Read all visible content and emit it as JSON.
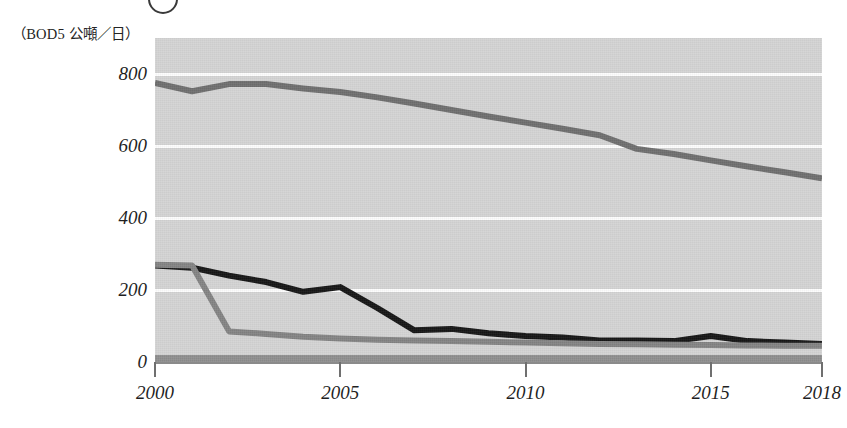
{
  "figure": {
    "badge_name": "circled-number-marker",
    "y_unit_label": "（BOD5 公噸／日）"
  },
  "chart_data": {
    "type": "line",
    "title": "",
    "subtitle": "",
    "xlabel": "",
    "ylabel": "（BOD5 公噸／日）",
    "ylim": [
      0,
      900
    ],
    "xlim": [
      2000,
      2018
    ],
    "grid": true,
    "gridlines": [
      200,
      400,
      600,
      800
    ],
    "legend_position": "none",
    "x": [
      2000,
      2001,
      2002,
      2003,
      2004,
      2005,
      2006,
      2007,
      2008,
      2009,
      2010,
      2011,
      2012,
      2013,
      2014,
      2015,
      2016,
      2017,
      2018
    ],
    "yticks": [
      "0",
      "200",
      "400",
      "600",
      "800"
    ],
    "ytick_values": [
      0,
      200,
      400,
      600,
      800
    ],
    "xticks": [
      "2000",
      "2005",
      "2010",
      "2015",
      "2018"
    ],
    "xtick_values": [
      2000,
      2005,
      2010,
      2015,
      2018
    ],
    "series": [
      {
        "name": "upper-series",
        "color": "#6e6e6e",
        "width": 6,
        "values": [
          775,
          752,
          772,
          772,
          760,
          750,
          735,
          718,
          700,
          682,
          665,
          648,
          630,
          592,
          578,
          560,
          543,
          527,
          510
        ]
      },
      {
        "name": "middle-series",
        "color": "#151515",
        "width": 6,
        "values": [
          268,
          262,
          240,
          222,
          195,
          208,
          150,
          88,
          92,
          80,
          72,
          68,
          60,
          60,
          58,
          72,
          58,
          54,
          50
        ]
      },
      {
        "name": "lower-series",
        "color": "#838383",
        "width": 6,
        "values": [
          270,
          268,
          85,
          78,
          70,
          65,
          62,
          60,
          58,
          56,
          54,
          52,
          50,
          49,
          48,
          47,
          46,
          45,
          45
        ]
      }
    ]
  }
}
